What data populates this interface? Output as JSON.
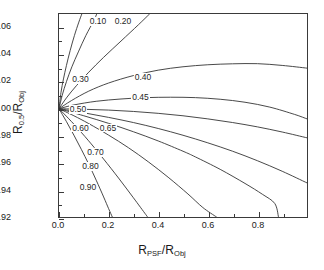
{
  "chart_data": {
    "type": "line",
    "title": "",
    "subtitle": "",
    "xlabel_main": "R",
    "xlabel_sub1": "PSF",
    "xlabel_mid": "/R",
    "xlabel_sub2": "Obj",
    "ylabel_main": "R",
    "ylabel_sub1": "0.5",
    "ylabel_mid": "/R",
    "ylabel_sub2": "Obj",
    "xlim": [
      0.0,
      1.0
    ],
    "ylim": [
      0.92,
      1.07
    ],
    "xticks": [
      0.0,
      0.2,
      0.4,
      0.6,
      0.8
    ],
    "xtick_labels": [
      "0.0",
      "0.2",
      "0.4",
      "0.6",
      "0.8"
    ],
    "yticks": [
      0.92,
      0.94,
      0.96,
      0.98,
      1.0,
      1.02,
      1.04,
      1.06
    ],
    "ytick_labels": [
      "0.92",
      "0.94",
      "0.96",
      "0.98",
      "1.00",
      "1.02",
      "1.04",
      "1.06"
    ],
    "grid": false,
    "legend": "none",
    "line_color": "#333333",
    "frame_color": "#3a3a3a",
    "background": "#ffffff",
    "series": [
      {
        "name": "0.10",
        "label": "0.10",
        "label_x": 0.155,
        "label_y": 1.064,
        "points": [
          [
            0.0,
            1.0
          ],
          [
            0.008,
            1.012
          ],
          [
            0.018,
            1.022
          ],
          [
            0.03,
            1.032
          ],
          [
            0.045,
            1.043
          ],
          [
            0.062,
            1.054
          ],
          [
            0.08,
            1.064
          ],
          [
            0.092,
            1.07
          ]
        ]
      },
      {
        "name": "0.20",
        "label": "0.20",
        "label_x": 0.255,
        "label_y": 1.064,
        "points": [
          [
            0.0,
            1.0
          ],
          [
            0.013,
            1.01
          ],
          [
            0.03,
            1.02
          ],
          [
            0.052,
            1.031
          ],
          [
            0.078,
            1.042
          ],
          [
            0.108,
            1.054
          ],
          [
            0.14,
            1.065
          ],
          [
            0.152,
            1.07
          ]
        ]
      },
      {
        "name": "0.30",
        "label": "0.30",
        "label_x": 0.085,
        "label_y": 1.0215,
        "points": [
          [
            0.0,
            1.0
          ],
          [
            0.03,
            1.008
          ],
          [
            0.07,
            1.017
          ],
          [
            0.12,
            1.027
          ],
          [
            0.18,
            1.038
          ],
          [
            0.25,
            1.05
          ],
          [
            0.32,
            1.062
          ],
          [
            0.365,
            1.07
          ]
        ]
      },
      {
        "name": "0.40",
        "label": "0.40",
        "label_x": 0.335,
        "label_y": 1.0235,
        "points": [
          [
            0.0,
            1.0
          ],
          [
            0.05,
            1.006
          ],
          [
            0.12,
            1.013
          ],
          [
            0.2,
            1.019
          ],
          [
            0.3,
            1.0245
          ],
          [
            0.4,
            1.0285
          ],
          [
            0.5,
            1.031
          ],
          [
            0.6,
            1.0325
          ],
          [
            0.7,
            1.0332
          ],
          [
            0.8,
            1.0333
          ],
          [
            0.9,
            1.032
          ],
          [
            1.0,
            1.03
          ]
        ]
      },
      {
        "name": "0.45",
        "label": "0.45",
        "label_x": 0.325,
        "label_y": 1.0085,
        "points": [
          [
            0.0,
            1.0
          ],
          [
            0.06,
            1.0028
          ],
          [
            0.15,
            1.0055
          ],
          [
            0.25,
            1.0072
          ],
          [
            0.35,
            1.0082
          ],
          [
            0.45,
            1.0085
          ],
          [
            0.55,
            1.0082
          ],
          [
            0.65,
            1.007
          ],
          [
            0.75,
            1.0048
          ],
          [
            0.85,
            1.0012
          ],
          [
            0.95,
            0.9958
          ],
          [
            1.0,
            0.9925
          ]
        ]
      },
      {
        "name": "0.50",
        "label": "0.50",
        "label_x": 0.075,
        "label_y": 0.9995,
        "points": [
          [
            0.0,
            1.0
          ],
          [
            0.1,
            0.9996
          ],
          [
            0.2,
            0.999
          ],
          [
            0.3,
            0.998
          ],
          [
            0.4,
            0.9966
          ],
          [
            0.5,
            0.9948
          ],
          [
            0.6,
            0.9925
          ],
          [
            0.7,
            0.9898
          ],
          [
            0.8,
            0.9866
          ],
          [
            0.9,
            0.9828
          ],
          [
            1.0,
            0.9785
          ]
        ]
      },
      {
        "name": "0.60",
        "label": "0.60",
        "label_x": 0.085,
        "label_y": 0.9862,
        "points": [
          [
            0.0,
            1.0
          ],
          [
            0.1,
            0.997
          ],
          [
            0.2,
            0.9936
          ],
          [
            0.3,
            0.9898
          ],
          [
            0.4,
            0.9854
          ],
          [
            0.5,
            0.9804
          ],
          [
            0.6,
            0.9748
          ],
          [
            0.7,
            0.9686
          ],
          [
            0.8,
            0.9616
          ],
          [
            0.9,
            0.9538
          ],
          [
            1.0,
            0.9452
          ]
        ]
      },
      {
        "name": "0.65",
        "label": "0.65",
        "label_x": 0.195,
        "label_y": 0.9862,
        "points": [
          [
            0.0,
            1.0
          ],
          [
            0.1,
            0.9948
          ],
          [
            0.2,
            0.9892
          ],
          [
            0.3,
            0.983
          ],
          [
            0.4,
            0.9762
          ],
          [
            0.5,
            0.9686
          ],
          [
            0.55,
            0.9644
          ],
          [
            0.65,
            0.9552
          ],
          [
            0.75,
            0.9448
          ],
          [
            0.82,
            0.9368
          ],
          [
            0.87,
            0.93
          ],
          [
            0.885,
            0.92
          ]
        ]
      },
      {
        "name": "0.70",
        "label": "0.70",
        "label_x": 0.145,
        "label_y": 0.9682,
        "points": [
          [
            0.0,
            1.0
          ],
          [
            0.06,
            0.9948
          ],
          [
            0.12,
            0.989
          ],
          [
            0.2,
            0.9805
          ],
          [
            0.28,
            0.9712
          ],
          [
            0.36,
            0.9608
          ],
          [
            0.44,
            0.9494
          ],
          [
            0.52,
            0.937
          ],
          [
            0.58,
            0.927
          ],
          [
            0.635,
            0.92
          ]
        ]
      },
      {
        "name": "0.80",
        "label": "0.80",
        "label_x": 0.125,
        "label_y": 0.9577,
        "points": [
          [
            0.0,
            1.0
          ],
          [
            0.04,
            0.9925
          ],
          [
            0.08,
            0.9846
          ],
          [
            0.13,
            0.974
          ],
          [
            0.18,
            0.9628
          ],
          [
            0.24,
            0.9488
          ],
          [
            0.3,
            0.9342
          ],
          [
            0.35,
            0.9218
          ],
          [
            0.357,
            0.92
          ]
        ]
      },
      {
        "name": "0.90",
        "label": "0.90",
        "label_x": 0.115,
        "label_y": 0.9425,
        "points": [
          [
            0.0,
            1.0
          ],
          [
            0.03,
            0.9905
          ],
          [
            0.06,
            0.9805
          ],
          [
            0.09,
            0.97
          ],
          [
            0.12,
            0.959
          ],
          [
            0.15,
            0.9472
          ],
          [
            0.18,
            0.9348
          ],
          [
            0.2,
            0.9262
          ],
          [
            0.215,
            0.92
          ]
        ]
      }
    ]
  }
}
